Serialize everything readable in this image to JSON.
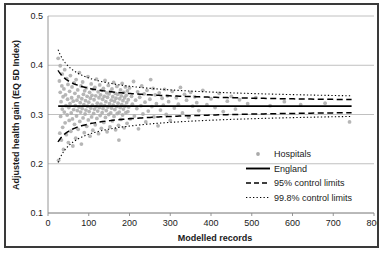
{
  "chart_data": {
    "type": "scatter",
    "title": "",
    "xlabel": "Modelled records",
    "ylabel": "Adjusted health gain (EQ 5D Index)",
    "xlim": [
      0,
      800
    ],
    "ylim": [
      0.1,
      0.5
    ],
    "xticks": [
      0,
      100,
      200,
      300,
      400,
      500,
      600,
      700,
      800
    ],
    "yticks": [
      0.1,
      0.2,
      0.3,
      0.4,
      0.5
    ],
    "xtick_labels": [
      "0",
      "100",
      "200",
      "300",
      "400",
      "500",
      "600",
      "700",
      "800"
    ],
    "ytick_labels": [
      "0.1",
      "0.2",
      "0.3",
      "0.4",
      "0.5"
    ],
    "grid": "horizontal",
    "legend_position": "inside-lower-right",
    "england_mean": 0.317,
    "series": [
      {
        "name": "Hospitals",
        "type": "scatter",
        "marker": "dot",
        "color": "#a9a9a9",
        "points": [
          [
            25,
            0.414
          ],
          [
            26,
            0.207
          ],
          [
            28,
            0.368
          ],
          [
            29,
            0.262
          ],
          [
            30,
            0.399
          ],
          [
            30,
            0.345
          ],
          [
            31,
            0.296
          ],
          [
            32,
            0.326
          ],
          [
            33,
            0.248
          ],
          [
            34,
            0.358
          ],
          [
            35,
            0.311
          ],
          [
            35,
            0.382
          ],
          [
            36,
            0.274
          ],
          [
            37,
            0.336
          ],
          [
            38,
            0.229
          ],
          [
            39,
            0.352
          ],
          [
            40,
            0.305
          ],
          [
            41,
            0.391
          ],
          [
            42,
            0.283
          ],
          [
            43,
            0.34
          ],
          [
            44,
            0.318
          ],
          [
            45,
            0.259
          ],
          [
            46,
            0.373
          ],
          [
            47,
            0.299
          ],
          [
            48,
            0.331
          ],
          [
            49,
            0.361
          ],
          [
            50,
            0.243
          ],
          [
            51,
            0.314
          ],
          [
            52,
            0.288
          ],
          [
            53,
            0.347
          ],
          [
            54,
            0.322
          ],
          [
            55,
            0.379
          ],
          [
            56,
            0.266
          ],
          [
            57,
            0.303
          ],
          [
            58,
            0.334
          ],
          [
            59,
            0.356
          ],
          [
            60,
            0.291
          ],
          [
            61,
            0.236
          ],
          [
            62,
            0.327
          ],
          [
            63,
            0.31
          ],
          [
            64,
            0.364
          ],
          [
            65,
            0.28
          ],
          [
            66,
            0.343
          ],
          [
            67,
            0.318
          ],
          [
            68,
            0.252
          ],
          [
            69,
            0.371
          ],
          [
            70,
            0.297
          ],
          [
            71,
            0.329
          ],
          [
            72,
            0.308
          ],
          [
            73,
            0.35
          ],
          [
            74,
            0.27
          ],
          [
            75,
            0.336
          ],
          [
            76,
            0.315
          ],
          [
            77,
            0.385
          ],
          [
            78,
            0.286
          ],
          [
            79,
            0.324
          ],
          [
            80,
            0.305
          ],
          [
            81,
            0.358
          ],
          [
            82,
            0.24
          ],
          [
            83,
            0.332
          ],
          [
            84,
            0.312
          ],
          [
            85,
            0.366
          ],
          [
            86,
            0.293
          ],
          [
            87,
            0.341
          ],
          [
            88,
            0.32
          ],
          [
            89,
            0.263
          ],
          [
            90,
            0.348
          ],
          [
            91,
            0.301
          ],
          [
            92,
            0.328
          ],
          [
            93,
            0.309
          ],
          [
            94,
            0.354
          ],
          [
            95,
            0.276
          ],
          [
            96,
            0.337
          ],
          [
            97,
            0.317
          ],
          [
            98,
            0.377
          ],
          [
            99,
            0.289
          ],
          [
            100,
            0.325
          ],
          [
            101,
            0.306
          ],
          [
            102,
            0.345
          ],
          [
            103,
            0.256
          ],
          [
            104,
            0.333
          ],
          [
            105,
            0.313
          ],
          [
            106,
            0.362
          ],
          [
            107,
            0.295
          ],
          [
            108,
            0.339
          ],
          [
            109,
            0.319
          ],
          [
            110,
            0.268
          ],
          [
            111,
            0.351
          ],
          [
            112,
            0.302
          ],
          [
            113,
            0.33
          ],
          [
            114,
            0.311
          ],
          [
            115,
            0.355
          ],
          [
            116,
            0.279
          ],
          [
            117,
            0.338
          ],
          [
            118,
            0.316
          ],
          [
            119,
            0.372
          ],
          [
            120,
            0.292
          ],
          [
            121,
            0.323
          ],
          [
            122,
            0.307
          ],
          [
            123,
            0.346
          ],
          [
            124,
            0.261
          ],
          [
            125,
            0.334
          ],
          [
            126,
            0.314
          ],
          [
            127,
            0.36
          ],
          [
            128,
            0.298
          ],
          [
            129,
            0.34
          ],
          [
            130,
            0.321
          ],
          [
            131,
            0.272
          ],
          [
            132,
            0.349
          ],
          [
            133,
            0.304
          ],
          [
            134,
            0.331
          ],
          [
            135,
            0.312
          ],
          [
            136,
            0.353
          ],
          [
            137,
            0.284
          ],
          [
            138,
            0.337
          ],
          [
            139,
            0.318
          ],
          [
            140,
            0.369
          ],
          [
            141,
            0.294
          ],
          [
            142,
            0.326
          ],
          [
            143,
            0.308
          ],
          [
            144,
            0.344
          ],
          [
            145,
            0.265
          ],
          [
            146,
            0.335
          ],
          [
            147,
            0.315
          ],
          [
            148,
            0.359
          ],
          [
            149,
            0.3
          ],
          [
            150,
            0.342
          ],
          [
            151,
            0.322
          ],
          [
            152,
            0.275
          ],
          [
            153,
            0.347
          ],
          [
            154,
            0.303
          ],
          [
            155,
            0.329
          ],
          [
            156,
            0.313
          ],
          [
            157,
            0.352
          ],
          [
            158,
            0.287
          ],
          [
            159,
            0.336
          ],
          [
            160,
            0.319
          ],
          [
            161,
            0.365
          ],
          [
            162,
            0.296
          ],
          [
            163,
            0.327
          ],
          [
            164,
            0.31
          ],
          [
            165,
            0.343
          ],
          [
            166,
            0.269
          ],
          [
            167,
            0.333
          ],
          [
            168,
            0.316
          ],
          [
            169,
            0.357
          ],
          [
            170,
            0.302
          ],
          [
            171,
            0.341
          ],
          [
            172,
            0.323
          ],
          [
            173,
            0.278
          ],
          [
            174,
            0.248
          ],
          [
            175,
            0.305
          ],
          [
            176,
            0.332
          ],
          [
            177,
            0.314
          ],
          [
            178,
            0.35
          ],
          [
            179,
            0.29
          ],
          [
            180,
            0.338
          ],
          [
            181,
            0.32
          ],
          [
            182,
            0.363
          ],
          [
            183,
            0.299
          ],
          [
            184,
            0.328
          ],
          [
            185,
            0.311
          ],
          [
            186,
            0.345
          ],
          [
            187,
            0.273
          ],
          [
            188,
            0.334
          ],
          [
            189,
            0.317
          ],
          [
            190,
            0.356
          ],
          [
            191,
            0.304
          ],
          [
            192,
            0.339
          ],
          [
            193,
            0.324
          ],
          [
            194,
            0.282
          ],
          [
            195,
            0.348
          ],
          [
            196,
            0.306
          ],
          [
            197,
            0.33
          ],
          [
            198,
            0.315
          ],
          [
            200,
            0.354
          ],
          [
            202,
            0.291
          ],
          [
            205,
            0.337
          ],
          [
            207,
            0.321
          ],
          [
            210,
            0.367
          ],
          [
            212,
            0.297
          ],
          [
            215,
            0.329
          ],
          [
            218,
            0.312
          ],
          [
            220,
            0.346
          ],
          [
            222,
            0.271
          ],
          [
            225,
            0.335
          ],
          [
            228,
            0.318
          ],
          [
            230,
            0.358
          ],
          [
            233,
            0.301
          ],
          [
            236,
            0.342
          ],
          [
            238,
            0.325
          ],
          [
            240,
            0.285
          ],
          [
            243,
            0.349
          ],
          [
            246,
            0.307
          ],
          [
            250,
            0.331
          ],
          [
            252,
            0.371
          ],
          [
            255,
            0.316
          ],
          [
            258,
            0.353
          ],
          [
            260,
            0.295
          ],
          [
            263,
            0.34
          ],
          [
            266,
            0.322
          ],
          [
            270,
            0.277
          ],
          [
            273,
            0.344
          ],
          [
            276,
            0.309
          ],
          [
            280,
            0.333
          ],
          [
            283,
            0.319
          ],
          [
            286,
            0.351
          ],
          [
            290,
            0.3
          ],
          [
            293,
            0.338
          ],
          [
            296,
            0.326
          ],
          [
            300,
            0.288
          ],
          [
            305,
            0.347
          ],
          [
            310,
            0.313
          ],
          [
            315,
            0.334
          ],
          [
            320,
            0.321
          ],
          [
            325,
            0.355
          ],
          [
            330,
            0.303
          ],
          [
            335,
            0.341
          ],
          [
            340,
            0.329
          ],
          [
            345,
            0.294
          ],
          [
            350,
            0.345
          ],
          [
            355,
            0.317
          ],
          [
            360,
            0.336
          ],
          [
            365,
            0.324
          ],
          [
            370,
            0.308
          ],
          [
            380,
            0.349
          ],
          [
            390,
            0.32
          ],
          [
            400,
            0.332
          ],
          [
            410,
            0.314
          ],
          [
            420,
            0.343
          ],
          [
            430,
            0.306
          ],
          [
            440,
            0.327
          ],
          [
            450,
            0.337
          ],
          [
            460,
            0.311
          ],
          [
            470,
            0.33
          ],
          [
            490,
            0.322
          ],
          [
            510,
            0.334
          ],
          [
            545,
            0.318
          ],
          [
            580,
            0.326
          ],
          [
            620,
            0.32
          ],
          [
            680,
            0.323
          ],
          [
            740,
            0.285
          ]
        ]
      },
      {
        "name": "England",
        "type": "line",
        "style": "solid",
        "color": "#000000",
        "value": 0.317
      },
      {
        "name": "95% control limits",
        "type": "line",
        "style": "dashed",
        "color": "#000000",
        "z": 1.96
      },
      {
        "name": "99.8% control limits",
        "type": "line",
        "style": "dotted",
        "color": "#000000",
        "z": 3.09
      }
    ],
    "funnel": {
      "sigma_unit": 0.185,
      "n_start": 25,
      "n_end": 745
    }
  },
  "legend": {
    "items": [
      {
        "label": "Hospitals",
        "marker": "dot"
      },
      {
        "label": "England",
        "marker": "solid-line"
      },
      {
        "label": "95% control limits",
        "marker": "dashed-line"
      },
      {
        "label": "99.8% control limits",
        "marker": "dotted-line"
      }
    ]
  }
}
